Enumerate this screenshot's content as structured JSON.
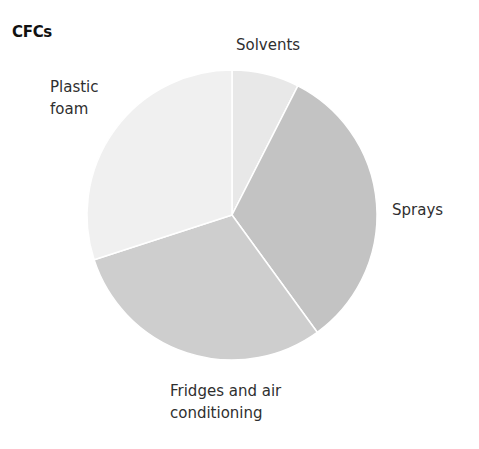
{
  "chart_data": {
    "type": "pie",
    "title": "CFCs",
    "categories": [
      "Solvents",
      "Sprays",
      "Fridges and air conditioning",
      "Plastic foam"
    ],
    "values": [
      7.5,
      32.5,
      30,
      30
    ],
    "unit": "percent (estimated from slice angles)",
    "start_angle_deg": 0,
    "direction": "clockwise",
    "colors": [
      "#e8e8e8",
      "#c3c3c3",
      "#cecece",
      "#f0f0f0"
    ],
    "legend": "none (direct labels)",
    "labels": {
      "solvents": [
        "Solvents"
      ],
      "sprays": [
        "Sprays"
      ],
      "fridges": [
        "Fridges and air",
        "conditioning"
      ],
      "plastic": [
        "Plastic",
        "foam"
      ]
    }
  },
  "chart": {
    "title": "CFCs",
    "center": [
      232,
      215
    ],
    "radius": 145,
    "separator_color": "#ffffff"
  }
}
